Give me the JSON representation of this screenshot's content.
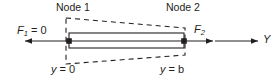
{
  "figure": {
    "type": "diagram",
    "background_color": "#ffffff",
    "line_color": "#231f20",
    "labels": {
      "node1": "Node 1",
      "node2": "Node 2",
      "force_left_var": "F",
      "force_left_sub": "1",
      "force_left_rest": " = 0",
      "force_right_var": "F",
      "force_right_sub": "2",
      "coord_left_var": "y",
      "coord_left_rest": " = 0",
      "coord_right_var": "y",
      "coord_right_rest": " = b",
      "axis": "Y"
    },
    "geometry": {
      "node1_x": 69,
      "node2_x": 184,
      "axis_y": 41,
      "element_top_y": 33,
      "element_bottom_y": 48,
      "dashed_left_top_y": 18,
      "dashed_left_bottom_y": 64,
      "dashed_right_top_y": 28,
      "dashed_right_bottom_y": 55,
      "force_left_arrow_tail_x": 69,
      "force_left_arrow_head_x": 25,
      "force_right_arrow_tail_x": 184,
      "force_right_arrow_head_x": 213,
      "axis_arrow_tail_x": 215,
      "axis_arrow_head_x": 258
    }
  }
}
